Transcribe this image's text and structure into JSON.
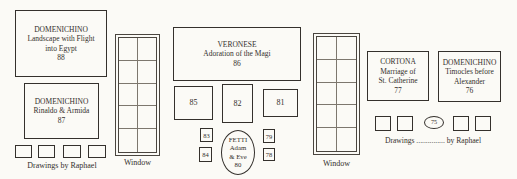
{
  "palette": {
    "ink": "#34302c",
    "paper": "#fbfaf6"
  },
  "paintings": {
    "p88": {
      "artist": "DOMENICHINO",
      "title1": "Landscape with Flight",
      "title2": "into Egypt",
      "num": "88"
    },
    "p87": {
      "artist": "DOMENICHINO",
      "title1": "Rinaldo & Armida",
      "num": "87"
    },
    "p86": {
      "artist": "VERONESE",
      "title1": "Adoration of the Magi",
      "num": "86"
    },
    "p85": {
      "num": "85"
    },
    "p82": {
      "num": "82"
    },
    "p81": {
      "num": "81"
    },
    "p83": {
      "num": "83"
    },
    "p84": {
      "num": "84"
    },
    "p80": {
      "artist": "FETTI",
      "title1": "Adam",
      "title2": "& Eve",
      "num": "80"
    },
    "p79": {
      "num": "79"
    },
    "p78": {
      "num": "78"
    },
    "p77": {
      "artist": "CORTONA",
      "title1": "Marriage of",
      "title2": "St. Catherine",
      "num": "77"
    },
    "p76": {
      "artist": "DOMENICHINO",
      "title1": "Timocles before",
      "title2": "Alexander",
      "num": "76"
    },
    "p75": {
      "num": "75"
    }
  },
  "labels": {
    "drawings_left": "Drawings by Raphael",
    "drawings_right": "Drawings ............... by Raphael",
    "window_left": "Window",
    "window_right": "Window"
  }
}
